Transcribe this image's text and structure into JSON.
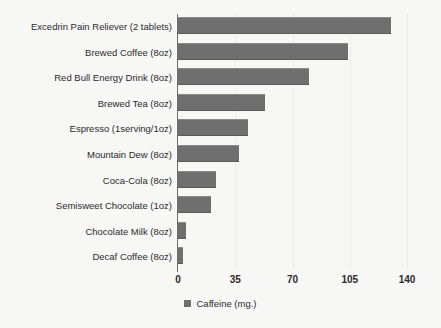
{
  "chart_data": {
    "type": "bar",
    "orientation": "horizontal",
    "title": "",
    "xlabel": "",
    "ylabel": "",
    "xlim": [
      0,
      140
    ],
    "xticks": [
      0,
      35,
      70,
      105,
      140
    ],
    "grid": true,
    "legend_position": "bottom",
    "legend": [
      "Caffeine (mg.)"
    ],
    "series_name": "Caffeine (mg.)",
    "categories": [
      "Excedrin Pain Reliever (2 tablets)",
      "Brewed Coffee (8oz)",
      "Red Bull Energy Drink (8oz)",
      "Brewed Tea (8oz)",
      "Espresso (1serving/1oz)",
      "Mountain Dew (8oz)",
      "Coca-Cola (8oz)",
      "Semisweet Chocolate (1oz)",
      "Chocolate Milk (8oz)",
      "Decaf Coffee (8oz)"
    ],
    "values": [
      130,
      104,
      80,
      53,
      43,
      37,
      23,
      20,
      5,
      3
    ]
  },
  "colors": {
    "bar": "#6f6f6f",
    "axis": "#6e6e6e",
    "grid": "#ececea",
    "text": "#2b2b2b",
    "background": "#f7f7f5"
  }
}
